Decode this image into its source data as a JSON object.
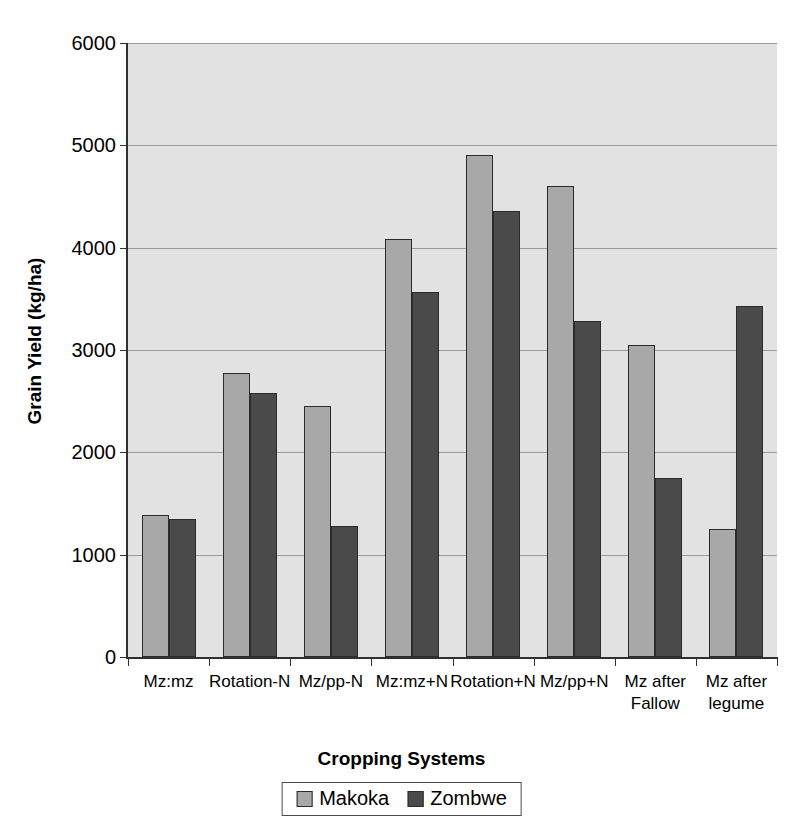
{
  "chart_data": {
    "type": "bar",
    "title": "",
    "xlabel": "Cropping Systems",
    "ylabel": "Grain Yield (kg/ha)",
    "ylim": [
      0,
      6000
    ],
    "ytick_labels": [
      "0",
      "1000",
      "2000",
      "3000",
      "4000",
      "5000",
      "6000"
    ],
    "ytick_values": [
      0,
      1000,
      2000,
      3000,
      4000,
      5000,
      6000
    ],
    "grid": true,
    "legend_position": "bottom",
    "categories": [
      "Mz:mz",
      "Rotation-N",
      "Mz/pp-N",
      "Mz:mz+N",
      "Rotation+N",
      "Mz/pp+N",
      "Mz after\nFallow",
      "Mz after\nlegume"
    ],
    "series": [
      {
        "name": "Makoka",
        "color": "#a8a8a8",
        "values": [
          1390,
          2780,
          2450,
          4080,
          4910,
          4600,
          3050,
          1250
        ]
      },
      {
        "name": "Zombwe",
        "color": "#4a4a4a",
        "values": [
          1350,
          2580,
          1280,
          3570,
          4360,
          3280,
          1750,
          3430
        ]
      }
    ]
  },
  "legend": {
    "items": [
      {
        "label": "Makoka",
        "swatch": "makoka"
      },
      {
        "label": "Zombwe",
        "swatch": "zombwe"
      }
    ]
  },
  "axes": {
    "y_title": "Grain Yield (kg/ha)",
    "x_title": "Cropping Systems"
  }
}
